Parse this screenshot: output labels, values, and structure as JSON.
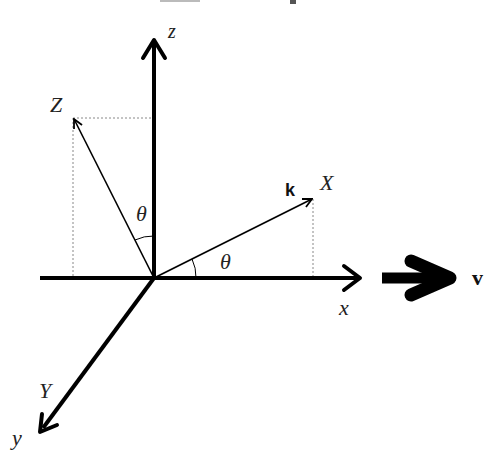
{
  "diagram": {
    "type": "coordinate-rotation",
    "axes": {
      "x": "x",
      "y": "y",
      "z": "z"
    },
    "rotated_axes": {
      "X": "X",
      "Y": "Y",
      "Z": "Z"
    },
    "angle_label": "θ",
    "angle_label_2": "θ",
    "wave_vector_label": "k",
    "velocity_label": "v",
    "colors": {
      "stroke": "#000000",
      "dotted": "#888888",
      "background": "#ffffff"
    }
  }
}
